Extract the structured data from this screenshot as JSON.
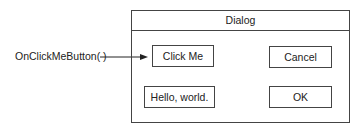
{
  "annotation": {
    "handler_label": "OnClickMeButton( )"
  },
  "dialog": {
    "title": "Dialog",
    "buttons": {
      "click_me": "Click Me",
      "cancel": "Cancel",
      "hello": "Hello, world.",
      "ok": "OK"
    }
  },
  "colors": {
    "stroke": "#444444",
    "text": "#222222",
    "background": "#ffffff"
  }
}
